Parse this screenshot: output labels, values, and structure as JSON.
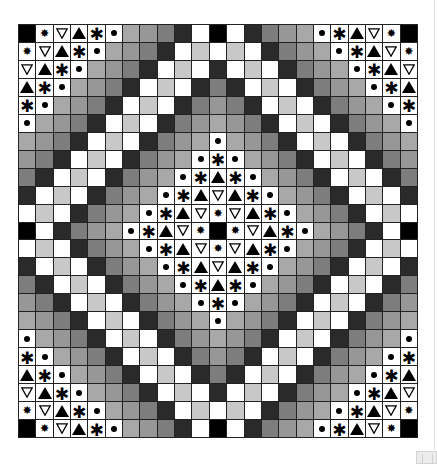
{
  "board": {
    "size": 23,
    "legend": {
      "K": {
        "kind": "fill",
        "color": "#000000"
      },
      "W": {
        "kind": "fill",
        "color": "#ffffff"
      },
      "L": {
        "kind": "fill",
        "color": "#c8c8c8"
      },
      "1": {
        "kind": "fill",
        "color": "#a8a8a8"
      },
      "2": {
        "kind": "fill",
        "color": "#979797"
      },
      "3": {
        "kind": "fill",
        "color": "#7d7d7d"
      },
      "4": {
        "kind": "fill",
        "color": "#2a2a2a"
      },
      "s": {
        "kind": "symbol",
        "icon": "star-burst-icon",
        "glyph": "✸"
      },
      "v": {
        "kind": "symbol",
        "icon": "triangle-down-outline-icon",
        "glyph": "▽"
      },
      "a": {
        "kind": "symbol",
        "icon": "triangle-up-filled-icon",
        "glyph": "▲"
      },
      "x": {
        "kind": "symbol",
        "icon": "asterisk-icon",
        "glyph": "✱"
      },
      "o": {
        "kind": "symbol",
        "icon": "dot-icon",
        "glyph": "•"
      }
    },
    "rows": [
      "Ksvaxo1234WKW4321oxavsK",
      "svaxo1234WLWLW4321oxavs",
      "vaxo1234WLW4WLW4321oxav",
      "axo1234WLW434WLW4321oxa",
      "xo1234WLW43234WLW4321ox",
      "o1234WLW4321234WLW4321o",
      "1234WLW4321o1234WLW4321",
      "234WLW4321oxo1234WLW432",
      "34WLW4321oxaxo1234WLW43",
      "4WLW4321oxavaxo1234WLW4",
      "WLW4321oxavsvaxo1234WLW",
      "KW4321oxavsKsvaxo1234WK",
      "WLW4321oxavsvaxo1234WLW",
      "4WLW4321oxavaxo1234WLW4",
      "34WLW4321oxaxo1234WLW43",
      "234WLW4321oxo1234WLW432",
      "1234WLW4321o1234WLW4321",
      "o1234WLW4321234WLW4321o",
      "xo1234WLW43234WLW4321ox",
      "axo1234WLW434WLW4321oxa",
      "vaxo1234WLW4WLW4321oxav",
      "svaxo1234WLWLW4321oxavs",
      "Ksvaxo1234WKW4321oxavsK"
    ]
  },
  "window": {
    "resize_handle": "resize-handle"
  }
}
